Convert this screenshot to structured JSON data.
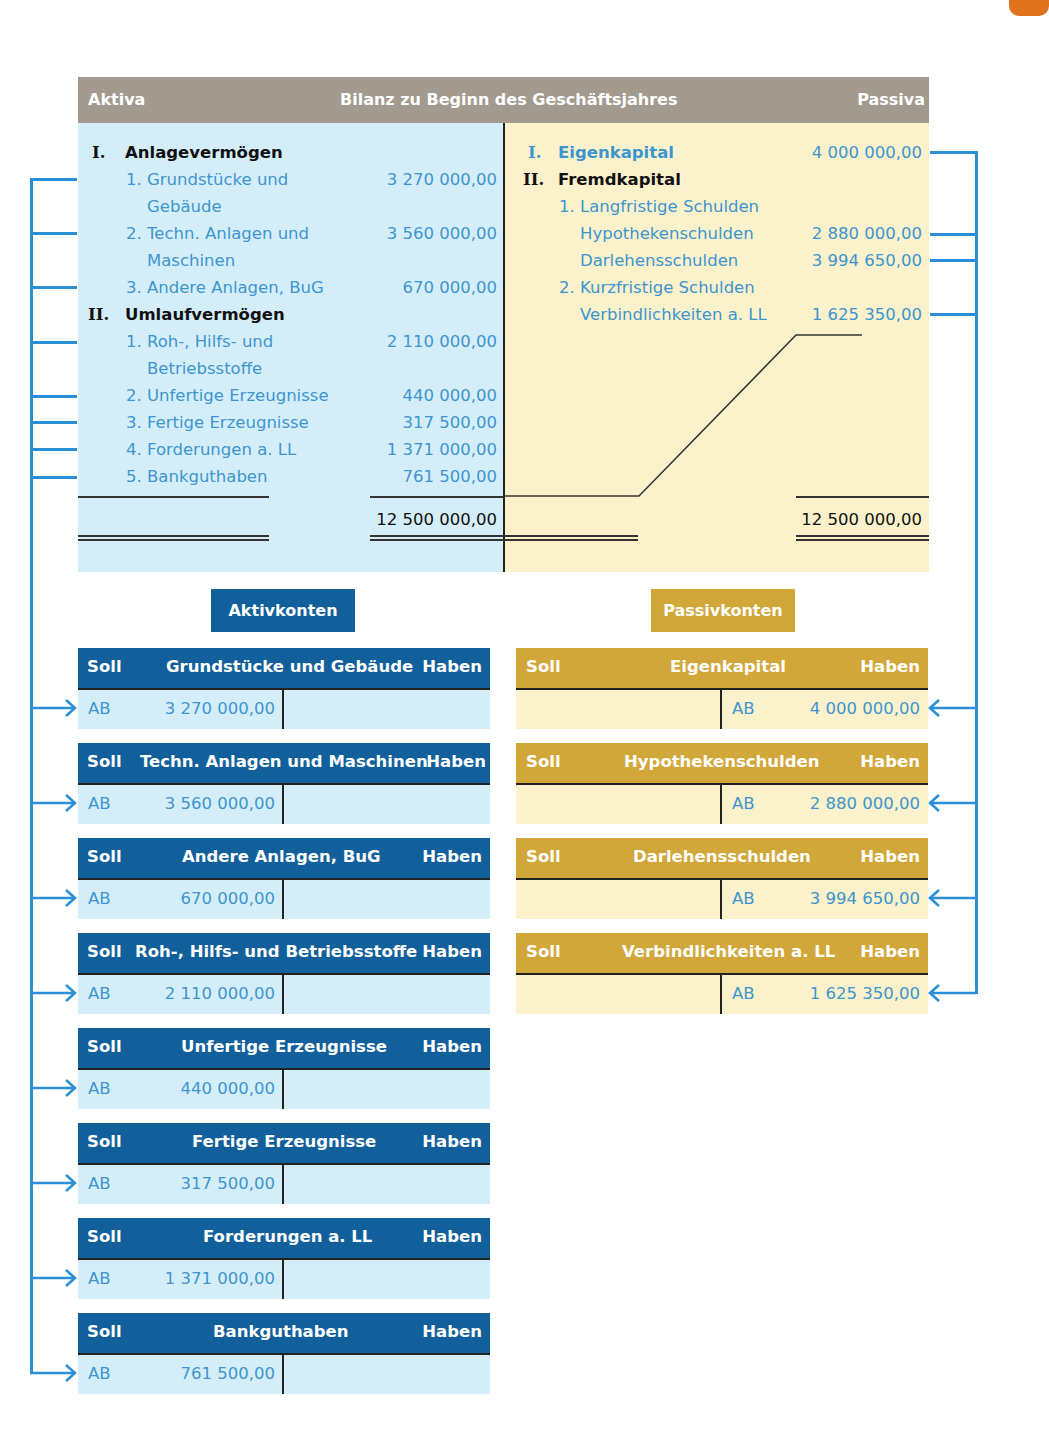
{
  "balance_sheet": {
    "header": {
      "left": "Aktiva",
      "title": "Bilanz zu Beginn des Geschäftsjahres",
      "right": "Passiva"
    },
    "aktiva": {
      "groups": [
        {
          "numeral": "I.",
          "label": "Anlagevermögen",
          "items": [
            {
              "label_line1": "1. Grundstücke und",
              "label_line2": "Gebäude",
              "value": "3 270 000,00"
            },
            {
              "label_line1": "2. Techn. Anlagen und",
              "label_line2": "Maschinen",
              "value": "3 560 000,00"
            },
            {
              "label_line1": "3. Andere Anlagen, BuG",
              "value": "670 000,00"
            }
          ]
        },
        {
          "numeral": "II.",
          "label": "Umlaufvermögen",
          "items": [
            {
              "label_line1": "1. Roh-, Hilfs- und",
              "label_line2": "Betriebsstoffe",
              "value": "2 110 000,00"
            },
            {
              "label_line1": "2. Unfertige Erzeugnisse",
              "value": "440 000,00"
            },
            {
              "label_line1": "3. Fertige Erzeugnisse",
              "value": "317 500,00"
            },
            {
              "label_line1": "4. Forderungen a. LL",
              "value": "1 371 000,00"
            },
            {
              "label_line1": "5. Bankguthaben",
              "value": "761 500,00"
            }
          ]
        }
      ],
      "total": "12 500 000,00"
    },
    "passiva": {
      "eigenkapital": {
        "numeral": "I.",
        "label": "Eigenkapital",
        "value": "4 000 000,00"
      },
      "fremdkapital": {
        "numeral": "II.",
        "label": "Fremdkapital",
        "long_term_label": "1. Langfristige Schulden",
        "long_term": [
          {
            "label": "Hypothekenschulden",
            "value": "2 880 000,00"
          },
          {
            "label": "Darlehensschulden",
            "value": "3 994 650,00"
          }
        ],
        "short_term_label": "2. Kurzfristige Schulden",
        "short_term": [
          {
            "label": "Verbindlichkeiten a. LL",
            "value": "1 625 350,00"
          }
        ]
      },
      "total": "12 500 000,00"
    }
  },
  "labels": {
    "aktivkonten": "Aktivkonten",
    "passivkonten": "Passivkonten"
  },
  "t_account_common": {
    "soll": "Soll",
    "haben": "Haben",
    "ab": "AB"
  },
  "aktivkonten": [
    {
      "title": "Grundstücke und Gebäude",
      "ab_value": "3 270 000,00"
    },
    {
      "title": "Techn. Anlagen und Maschinen",
      "ab_value": "3 560 000,00"
    },
    {
      "title": "Andere Anlagen, BuG",
      "ab_value": "670 000,00"
    },
    {
      "title": "Roh-, Hilfs- und Betriebsstoffe",
      "ab_value": "2 110 000,00"
    },
    {
      "title": "Unfertige Erzeugnisse",
      "ab_value": "440 000,00"
    },
    {
      "title": "Fertige Erzeugnisse",
      "ab_value": "317 500,00"
    },
    {
      "title": "Forderungen a. LL",
      "ab_value": "1 371 000,00"
    },
    {
      "title": "Bankguthaben",
      "ab_value": "761 500,00"
    }
  ],
  "passivkonten": [
    {
      "title": "Eigenkapital",
      "ab_value": "4 000 000,00"
    },
    {
      "title": "Hypothekenschulden",
      "ab_value": "2 880 000,00"
    },
    {
      "title": "Darlehensschulden",
      "ab_value": "3 994 650,00"
    },
    {
      "title": "Verbindlichkeiten a. LL",
      "ab_value": "1 625 350,00"
    }
  ],
  "colors": {
    "aktiv_header": "#12609b",
    "aktiv_body": "#d4eef9",
    "passiv_header": "#d1a73a",
    "passiv_body": "#fbf2cc",
    "balance_header": "#a39a8f",
    "connector": "#2a8fd6",
    "value_text": "#3d95cf"
  }
}
